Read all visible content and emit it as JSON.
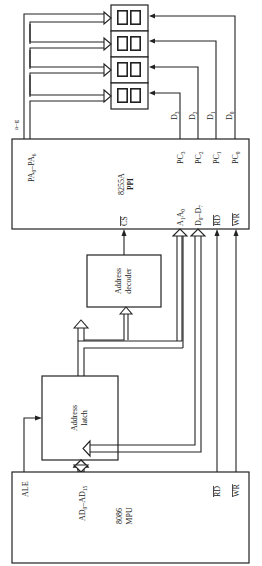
{
  "diagram": {
    "orientation": "rotated 90 degrees clockwise",
    "blocks": {
      "ppi": {
        "name": "8255A",
        "subtitle": "PPI"
      },
      "mpu": {
        "name": "8086",
        "subtitle": "MPU"
      },
      "latch": {
        "line1": "Address",
        "line2": "latch"
      },
      "decoder": {
        "line1": "Address",
        "line2": "decoder"
      },
      "displays": {
        "count": 4,
        "digits_per_display": 2,
        "glyph": "8"
      }
    },
    "ppi_pins": {
      "pa": {
        "base": "PA",
        "from_sub": "0",
        "to_sub": "6",
        "sep": "–"
      },
      "pc3": {
        "base": "PC",
        "sub": "3"
      },
      "pc2": {
        "base": "PC",
        "sub": "2"
      },
      "pc1": {
        "base": "PC",
        "sub": "1"
      },
      "pc0": {
        "base": "PC",
        "sub": "0"
      },
      "cs": "CS",
      "a1a0": {
        "a": "A",
        "sub1": "1",
        "b": "A",
        "sub0": "0"
      },
      "d0d7": {
        "base": "D",
        "from_sub": "0",
        "to_sub": "7",
        "sep": "–"
      },
      "rd": "RD",
      "wr": "WR"
    },
    "mpu_pins": {
      "ale": "ALE",
      "ad": {
        "base": "AD",
        "from_sub": "0",
        "to_sub": "15",
        "sep": "–"
      },
      "rd": "RD",
      "wr": "WR"
    },
    "signals": {
      "segments": "a–g",
      "digit_drives": [
        {
          "base": "D",
          "sub": "3"
        },
        {
          "base": "D",
          "sub": "2"
        },
        {
          "base": "D",
          "sub": "1"
        },
        {
          "base": "D",
          "sub": "0"
        }
      ]
    }
  }
}
